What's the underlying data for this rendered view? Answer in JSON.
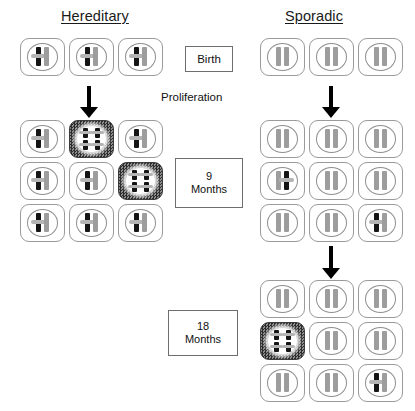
{
  "figure": {
    "columns": [
      {
        "id": "hereditary",
        "title": "Hereditary"
      },
      {
        "id": "sporadic",
        "title": "Sporadic"
      }
    ],
    "stage_labels": {
      "birth": "Birth",
      "proliferation": "Proliferation",
      "nine_months_number": "9",
      "nine_months_unit": "Months",
      "eighteen_months_number": "18",
      "eighteen_months_unit": "Months"
    },
    "legend_semantics": {
      "normal_chromosome": "normal-chromosome-gray",
      "mutant_chromosome": "mutated-chromosome-black",
      "tumor_cell": "tumor-cell-dark-shaded"
    },
    "colors": {
      "normal_chromosome": "#9d9d9d",
      "mutant_chromosome": "#151515",
      "tumor_cell_fill": "#4a4a4a",
      "cell_border": "#9a9a9a",
      "background": "#ffffff"
    },
    "arrows": [
      {
        "id": "hereditary-birth-to-9mo",
        "direction": "down"
      },
      {
        "id": "sporadic-birth-to-9mo",
        "direction": "down"
      },
      {
        "id": "sporadic-9mo-to-18mo",
        "direction": "down"
      }
    ],
    "grids": {
      "hereditary_birth": {
        "rows": 1,
        "cols": 3,
        "cells": [
          {
            "type": "pair",
            "left": "mutant",
            "right": "normal",
            "tumor": false
          },
          {
            "type": "pair",
            "left": "mutant",
            "right": "normal",
            "tumor": false
          },
          {
            "type": "pair",
            "left": "mutant",
            "right": "normal",
            "tumor": false
          }
        ]
      },
      "hereditary_9_months": {
        "rows": 3,
        "cols": 3,
        "cells": [
          {
            "type": "pair",
            "left": "mutant",
            "right": "normal",
            "tumor": false
          },
          {
            "type": "quad",
            "left": "mutant",
            "right": "mutant",
            "tumor": true
          },
          {
            "type": "pair",
            "left": "mutant",
            "right": "normal",
            "tumor": false
          },
          {
            "type": "pair",
            "left": "mutant",
            "right": "normal",
            "tumor": false
          },
          {
            "type": "pair",
            "left": "mutant",
            "right": "normal",
            "tumor": false
          },
          {
            "type": "quad",
            "left": "mutant",
            "right": "mutant",
            "tumor": true
          },
          {
            "type": "pair",
            "left": "mutant",
            "right": "normal",
            "tumor": false
          },
          {
            "type": "pair",
            "left": "mutant",
            "right": "normal",
            "tumor": false
          },
          {
            "type": "pair",
            "left": "mutant",
            "right": "normal",
            "tumor": false
          }
        ]
      },
      "sporadic_birth": {
        "rows": 1,
        "cols": 3,
        "cells": [
          {
            "type": "pair",
            "left": "normal",
            "right": "normal",
            "tumor": false
          },
          {
            "type": "pair",
            "left": "normal",
            "right": "normal",
            "tumor": false
          },
          {
            "type": "pair",
            "left": "normal",
            "right": "normal",
            "tumor": false
          }
        ]
      },
      "sporadic_9_months": {
        "rows": 3,
        "cols": 3,
        "cells": [
          {
            "type": "pair",
            "left": "normal",
            "right": "normal",
            "tumor": false
          },
          {
            "type": "pair",
            "left": "normal",
            "right": "normal",
            "tumor": false
          },
          {
            "type": "pair",
            "left": "normal",
            "right": "normal",
            "tumor": false
          },
          {
            "type": "pair",
            "left": "normal",
            "right": "mutant",
            "tumor": false
          },
          {
            "type": "pair",
            "left": "normal",
            "right": "normal",
            "tumor": false
          },
          {
            "type": "pair",
            "left": "normal",
            "right": "normal",
            "tumor": false
          },
          {
            "type": "pair",
            "left": "normal",
            "right": "normal",
            "tumor": false
          },
          {
            "type": "pair",
            "left": "normal",
            "right": "normal",
            "tumor": false
          },
          {
            "type": "pair",
            "left": "mutant",
            "right": "normal",
            "tumor": false
          }
        ]
      },
      "sporadic_18_months": {
        "rows": 3,
        "cols": 3,
        "cells": [
          {
            "type": "pair",
            "left": "normal",
            "right": "normal",
            "tumor": false
          },
          {
            "type": "pair",
            "left": "normal",
            "right": "normal",
            "tumor": false
          },
          {
            "type": "pair",
            "left": "normal",
            "right": "normal",
            "tumor": false
          },
          {
            "type": "quad",
            "left": "mutant",
            "right": "mutant",
            "tumor": true
          },
          {
            "type": "pair",
            "left": "normal",
            "right": "normal",
            "tumor": false
          },
          {
            "type": "pair",
            "left": "normal",
            "right": "normal",
            "tumor": false
          },
          {
            "type": "pair",
            "left": "normal",
            "right": "normal",
            "tumor": false
          },
          {
            "type": "pair",
            "left": "normal",
            "right": "normal",
            "tumor": false
          },
          {
            "type": "pair",
            "left": "mutant",
            "right": "normal",
            "tumor": false
          }
        ]
      }
    }
  }
}
